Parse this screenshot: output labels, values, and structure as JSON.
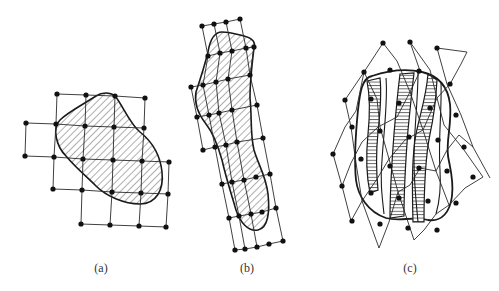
{
  "figure": {
    "panels": [
      {
        "id": "a",
        "label": "(a)",
        "description": "square grid overlaid on diagonally hatched blob"
      },
      {
        "id": "b",
        "label": "(b)",
        "description": "tilted elongated grid overlaid on diagonally hatched elongated blob"
      },
      {
        "id": "c",
        "label": "(c)",
        "description": "rhombic lattice overlaid on rounded blob with horizontally hatched wavy strips"
      }
    ]
  },
  "colors": {
    "line": "#2a2a2a",
    "node": "#111111",
    "hatch": "#333333",
    "background": "#ffffff"
  }
}
